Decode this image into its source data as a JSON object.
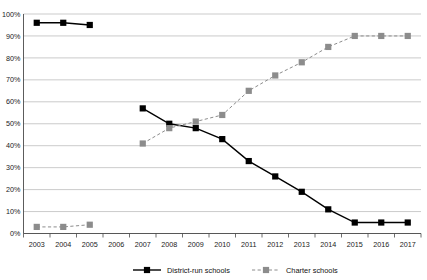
{
  "chart_data": {
    "type": "line",
    "title": "",
    "subtitle": "",
    "xlabel": "",
    "ylabel": "",
    "ylim": [
      0,
      100
    ],
    "y_ticks": [
      0,
      10,
      20,
      30,
      40,
      50,
      60,
      70,
      80,
      90,
      100
    ],
    "y_tick_labels": [
      "0%",
      "10%",
      "20%",
      "30%",
      "40%",
      "50%",
      "60%",
      "70%",
      "80%",
      "90%",
      "100%"
    ],
    "categories": [
      "2003",
      "2004",
      "2005",
      "2006",
      "2007",
      "2008",
      "2009",
      "2010",
      "2011",
      "2012",
      "2013",
      "2014",
      "2015",
      "2016",
      "2017"
    ],
    "grid": "horizontal",
    "legend_position": "bottom",
    "series": [
      {
        "name": "District-run schools",
        "color": "#000000",
        "line_style": "solid",
        "marker": "square",
        "values": [
          96,
          96,
          95,
          null,
          57,
          50,
          48,
          43,
          33,
          26,
          19,
          11,
          5,
          5,
          5
        ]
      },
      {
        "name": "Charter schools",
        "color": "#8c8c8c",
        "line_style": "dashed",
        "marker": "square",
        "values": [
          3,
          3,
          4,
          null,
          41,
          48,
          51,
          54,
          65,
          72,
          78,
          85,
          90,
          90,
          90
        ]
      }
    ]
  },
  "legend": {
    "items": [
      {
        "label": "District-run schools"
      },
      {
        "label": "Charter schools"
      }
    ]
  },
  "colors": {
    "district": "#000000",
    "charter": "#8c8c8c",
    "gridline": "#b4b4b4",
    "axis": "#4a4a4a",
    "text": "#1a1a1a",
    "background": "#ffffff"
  }
}
